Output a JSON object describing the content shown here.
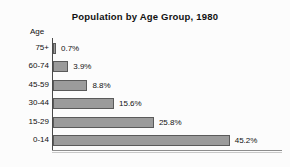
{
  "chart_data": {
    "type": "bar",
    "orientation": "horizontal",
    "title": "Population by Age Group, 1980",
    "xlabel": "",
    "ylabel": "Age",
    "categories": [
      "75+",
      "60-74",
      "45-59",
      "30-44",
      "15-29",
      "0-14"
    ],
    "values": [
      0.7,
      3.9,
      8.8,
      15.6,
      25.8,
      45.2
    ],
    "data_labels": [
      "0.7%",
      "3.9%",
      "8.8%",
      "15.6%",
      "25.8%",
      "45.2%"
    ],
    "xlim": [
      0,
      50
    ],
    "grid": false,
    "legend": null,
    "bar_fill_color": "#9b9b9b",
    "bar_border_color": "#5a5a5a",
    "axis_color": "#4a4a4a",
    "background_color": "#fcfcfc",
    "text_color": "#111111"
  },
  "axis": {
    "header_label": "Age"
  }
}
